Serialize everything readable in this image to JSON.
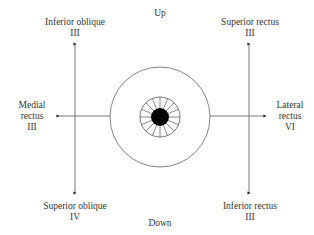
{
  "diagram": {
    "directions": {
      "up": "Up",
      "down": "Down"
    },
    "muscles": {
      "inferior_oblique": {
        "name": "Inferior oblique",
        "nerve": "III",
        "position": "upper-left",
        "arrow": "up"
      },
      "superior_rectus": {
        "name": "Superior rectus",
        "nerve": "III",
        "position": "upper-right",
        "arrow": "up"
      },
      "medial_rectus": {
        "name_line1": "Medial",
        "name_line2": "rectus",
        "nerve": "III",
        "position": "left",
        "arrow": "left"
      },
      "lateral_rectus": {
        "name_line1": "Lateral",
        "name_line2": "rectus",
        "nerve": "VI",
        "position": "right",
        "arrow": "right"
      },
      "superior_oblique": {
        "name": "Superior oblique",
        "nerve": "IV",
        "position": "lower-left",
        "arrow": "down"
      },
      "inferior_rectus": {
        "name": "Inferior rectus",
        "nerve": "III",
        "position": "lower-right",
        "arrow": "down"
      }
    },
    "eye": {
      "outer_circle": {
        "cx": 160,
        "cy": 117,
        "r": 50
      },
      "iris": {
        "cx": 160,
        "cy": 117,
        "r": 20,
        "spokes": 16
      },
      "pupil": {
        "cx": 160,
        "cy": 117,
        "r": 9
      }
    },
    "colors": {
      "line": "#555555",
      "pupil": "#000000",
      "text": "#333333"
    }
  }
}
